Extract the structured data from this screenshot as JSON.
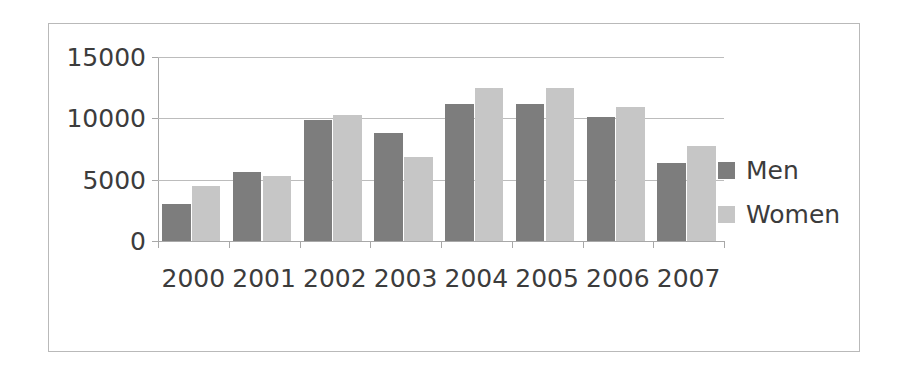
{
  "chart_data": {
    "type": "bar",
    "title": "",
    "subtitle": "",
    "xlabel": "",
    "ylabel": "",
    "categories": [
      "2000",
      "2001",
      "2002",
      "2003",
      "2004",
      "2005",
      "2006",
      "2007"
    ],
    "series": [
      {
        "name": "Men",
        "color": "#7d7d7d",
        "values": [
          3050,
          5650,
          9850,
          8800,
          11200,
          11200,
          10150,
          6400
        ]
      },
      {
        "name": "Women",
        "color": "#c6c6c6",
        "values": [
          4450,
          5300,
          10250,
          6850,
          12450,
          12450,
          10950,
          7750
        ]
      }
    ],
    "ylim": [
      0,
      15000
    ],
    "yticks": [
      0,
      5000,
      10000,
      15000
    ],
    "ytick_labels": [
      "0",
      "5000",
      "10000",
      "15000"
    ],
    "grid": true,
    "legend_position": "right",
    "frame_border_color": "#b9b9b9",
    "gridline_color": "#bcbcbc",
    "axis_color": "#a8a8a8",
    "background": "#ffffff"
  },
  "legend": {
    "entries": [
      {
        "label": "Men"
      },
      {
        "label": "Women"
      }
    ]
  }
}
